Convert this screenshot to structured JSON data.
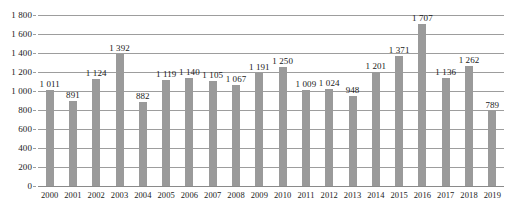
{
  "chart_data": {
    "type": "bar",
    "title": "",
    "xlabel": "",
    "ylabel": "",
    "ylim": [
      0,
      1800
    ],
    "grid": true,
    "legend": "none",
    "thousands_separator": " ",
    "bar_color": "#9a9a9a",
    "gridline_color": "#9d9d9d",
    "categories": [
      "2000",
      "2001",
      "2002",
      "2003",
      "2004",
      "2005",
      "2006",
      "2007",
      "2008",
      "2009",
      "2010",
      "2011",
      "2012",
      "2013",
      "2014",
      "2015",
      "2016",
      "2017",
      "2018",
      "2019"
    ],
    "values": [
      1011,
      891,
      1124,
      1392,
      882,
      1119,
      1140,
      1105,
      1067,
      1191,
      1250,
      1009,
      1024,
      948,
      1201,
      1371,
      1707,
      1136,
      1262,
      789
    ],
    "data_labels": [
      "1 011",
      "891",
      "1 124",
      "1 392",
      "882",
      "1 119",
      "1 140",
      "1 105",
      "1 067",
      "1 191",
      "1 250",
      "1 009",
      "1 024",
      "948",
      "1 201",
      "1 371",
      "1 707",
      "1 136",
      "1 262",
      "789"
    ],
    "y_ticks": [
      0,
      200,
      400,
      600,
      800,
      1000,
      1200,
      1400,
      1600,
      1800
    ],
    "y_tick_labels": [
      "0",
      "200",
      "400",
      "600",
      "800",
      "1 000",
      "1 200",
      "1 400",
      "1 600",
      "1 800"
    ]
  }
}
